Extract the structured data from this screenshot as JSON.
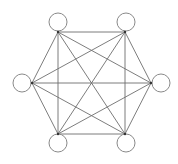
{
  "diagram": {
    "type": "complete-graph",
    "name": "K6",
    "node_count": 6,
    "nodes": [
      {
        "id": "n1",
        "label": "",
        "position": "top-left"
      },
      {
        "id": "n2",
        "label": "",
        "position": "top-right"
      },
      {
        "id": "n3",
        "label": "",
        "position": "right"
      },
      {
        "id": "n4",
        "label": "",
        "position": "bottom-right"
      },
      {
        "id": "n5",
        "label": "",
        "position": "bottom-left"
      },
      {
        "id": "n6",
        "label": "",
        "position": "left"
      }
    ],
    "edges": [
      [
        "n1",
        "n2"
      ],
      [
        "n1",
        "n3"
      ],
      [
        "n1",
        "n4"
      ],
      [
        "n1",
        "n5"
      ],
      [
        "n1",
        "n6"
      ],
      [
        "n2",
        "n3"
      ],
      [
        "n2",
        "n4"
      ],
      [
        "n2",
        "n5"
      ],
      [
        "n2",
        "n6"
      ],
      [
        "n3",
        "n4"
      ],
      [
        "n3",
        "n5"
      ],
      [
        "n3",
        "n6"
      ],
      [
        "n4",
        "n5"
      ],
      [
        "n4",
        "n6"
      ],
      [
        "n5",
        "n6"
      ]
    ],
    "colors": {
      "edge": "#6e6e6e",
      "node_stroke": "#8a8a8a",
      "node_fill": "#ffffff",
      "background": "#ffffff"
    }
  }
}
